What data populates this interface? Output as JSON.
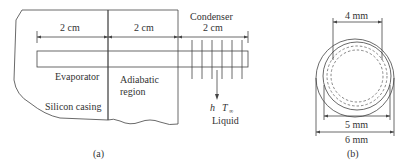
{
  "figure_a": {
    "label": "(a)",
    "sections": [
      {
        "name": "evaporator",
        "length_label": "2 cm",
        "label": "Evaporator"
      },
      {
        "name": "adiabatic",
        "length_label": "2 cm",
        "label_line1": "Adiabatic",
        "label_line2": "region"
      },
      {
        "name": "condenser",
        "length_label": "2 cm",
        "title": "Condenser"
      }
    ],
    "casing_label": "Silicon casing",
    "convection": {
      "h_label": "h",
      "t_label": "T",
      "t_subscript": "∞",
      "fluid_label": "Liquid"
    },
    "fin_count": 6
  },
  "figure_b": {
    "label": "(b)",
    "dimensions": {
      "inner": "4 mm",
      "middle": "5 mm",
      "outer": "6 mm"
    }
  }
}
